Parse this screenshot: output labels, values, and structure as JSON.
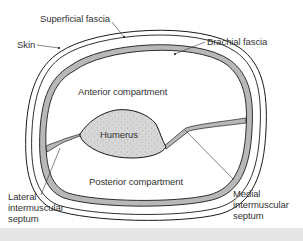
{
  "diagram": {
    "labels": {
      "superficial_fascia": "Superficial fascia",
      "skin": "Skin",
      "brachial_fascia": "Brachial fascia",
      "anterior_compartment": "Anterior compartment",
      "humerus": "Humerus",
      "posterior_compartment": "Posterior compartment",
      "lateral_septum": [
        "Lateral",
        "intermuscular",
        "septum"
      ],
      "medial_septum": [
        "Medial",
        "intermuscular",
        "septum"
      ]
    },
    "colors": {
      "line": "#1a1a1a",
      "fascia_fill": "#b8b8b8",
      "bone_fill": "#d4d4d4",
      "text": "#333333",
      "background": "#ffffff",
      "bottom_strip": "#e6e6e6"
    }
  }
}
